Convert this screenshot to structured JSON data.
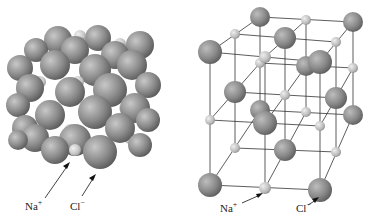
{
  "figure": {
    "left_panel": {
      "description": "space-filling model",
      "labels": {
        "cation": "Na",
        "cation_charge": "+",
        "anion": "Cl",
        "anion_charge": "−"
      }
    },
    "right_panel": {
      "description": "ball-and-stick lattice model",
      "labels": {
        "cation": "Na",
        "cation_charge": "+",
        "anion": "Cl",
        "anion_charge": "−"
      }
    },
    "colors": {
      "anion": "#7a7a7a",
      "cation": "#b8b8b8",
      "bond": "#333333",
      "arrow": "#111111"
    }
  }
}
